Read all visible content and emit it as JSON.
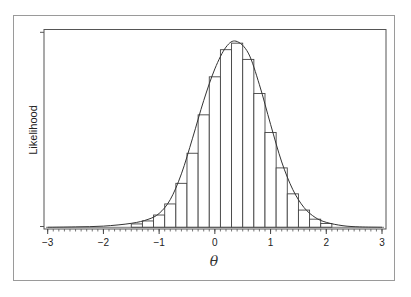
{
  "chart_data": {
    "type": "bar",
    "title": "",
    "xlabel": "θ",
    "ylabel": "Likelihood",
    "xlim": [
      -3,
      3
    ],
    "ylim": [
      0,
      1
    ],
    "x_ticks": [
      -3,
      -2,
      -1,
      0,
      1,
      2,
      3
    ],
    "x_tick_labels": [
      "−3",
      "−2",
      "−1",
      "0",
      "1",
      "2",
      "3"
    ],
    "x_minor_tick_step": 0.1,
    "y_tick_labels": [],
    "grid": false,
    "legend": null,
    "bin_width": 0.2,
    "bins": [
      {
        "left": -1.5,
        "right": -1.3,
        "value": 0.017
      },
      {
        "left": -1.3,
        "right": -1.1,
        "value": 0.032
      },
      {
        "left": -1.1,
        "right": -0.9,
        "value": 0.062
      },
      {
        "left": -0.9,
        "right": -0.7,
        "value": 0.118
      },
      {
        "left": -0.7,
        "right": -0.5,
        "value": 0.222
      },
      {
        "left": -0.5,
        "right": -0.3,
        "value": 0.374
      },
      {
        "left": -0.3,
        "right": -0.1,
        "value": 0.568
      },
      {
        "left": -0.1,
        "right": 0.1,
        "value": 0.76
      },
      {
        "left": 0.1,
        "right": 0.3,
        "value": 0.897
      },
      {
        "left": 0.3,
        "right": 0.5,
        "value": 0.93
      },
      {
        "left": 0.5,
        "right": 0.7,
        "value": 0.848
      },
      {
        "left": 0.7,
        "right": 0.9,
        "value": 0.676
      },
      {
        "left": 0.9,
        "right": 1.1,
        "value": 0.479
      },
      {
        "left": 1.1,
        "right": 1.3,
        "value": 0.3
      },
      {
        "left": 1.3,
        "right": 1.5,
        "value": 0.169
      },
      {
        "left": 1.5,
        "right": 1.7,
        "value": 0.087
      },
      {
        "left": 1.7,
        "right": 1.9,
        "value": 0.041
      },
      {
        "left": 1.9,
        "right": 2.1,
        "value": 0.019
      }
    ],
    "curve": {
      "type": "line",
      "description": "smooth likelihood curve overlaid on histogram",
      "peak_x": 0.38,
      "peak_value": 0.94,
      "x": [
        -3.0,
        -2.5,
        -2.0,
        -1.5,
        -1.2,
        -1.0,
        -0.8,
        -0.6,
        -0.4,
        -0.2,
        0.0,
        0.2,
        0.38,
        0.6,
        0.8,
        1.0,
        1.2,
        1.4,
        1.6,
        1.8,
        2.0,
        2.3,
        2.6,
        3.0
      ],
      "y": [
        0.0,
        0.002,
        0.006,
        0.02,
        0.04,
        0.07,
        0.14,
        0.27,
        0.45,
        0.64,
        0.8,
        0.91,
        0.94,
        0.88,
        0.72,
        0.52,
        0.33,
        0.19,
        0.1,
        0.05,
        0.025,
        0.008,
        0.002,
        0.0
      ]
    }
  },
  "caption_fragment": ""
}
